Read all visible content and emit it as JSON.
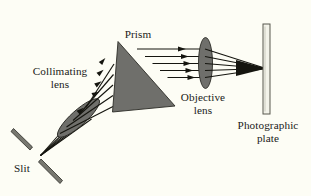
{
  "figure": {
    "type": "optics-ray-diagram",
    "title_visible": false,
    "background_color": "#fdfdf5",
    "ink_color": "#1a1a18",
    "component_fill": "#6f6f6b",
    "component_stroke": "#2a2a28"
  },
  "labels": {
    "prism": "Prism",
    "collimating_lens_line1": "Collimating",
    "collimating_lens_line2": "lens",
    "objective_lens_line1": "Objective",
    "objective_lens_line2": "lens",
    "photographic_plate_line1": "Photographic",
    "photographic_plate_line2": "plate",
    "slit": "Slit"
  },
  "components": [
    {
      "name": "slit",
      "label": "Slit",
      "shape": "two-parallel-bars",
      "fill": "#6f6f6b"
    },
    {
      "name": "collimating-lens",
      "label": "Collimating lens",
      "shape": "tilted-ellipse",
      "fill": "#6f6f6b"
    },
    {
      "name": "prism",
      "label": "Prism",
      "shape": "triangle",
      "fill": "#6f6f6b"
    },
    {
      "name": "objective-lens",
      "label": "Objective lens",
      "shape": "vertical-ellipse",
      "fill": "#6f6f6b"
    },
    {
      "name": "photographic-plate",
      "label": "Photographic plate",
      "shape": "vertical-bar",
      "fill": "#f2f2ea"
    }
  ],
  "rays": {
    "ray_count": 5,
    "segment_slit_to_collimating": "diverging",
    "segment_collimating_to_prism": "parallel-ascending",
    "segment_prism_to_objective": "parallel-horizontal",
    "segment_objective_to_plate": "converging-to-point"
  }
}
